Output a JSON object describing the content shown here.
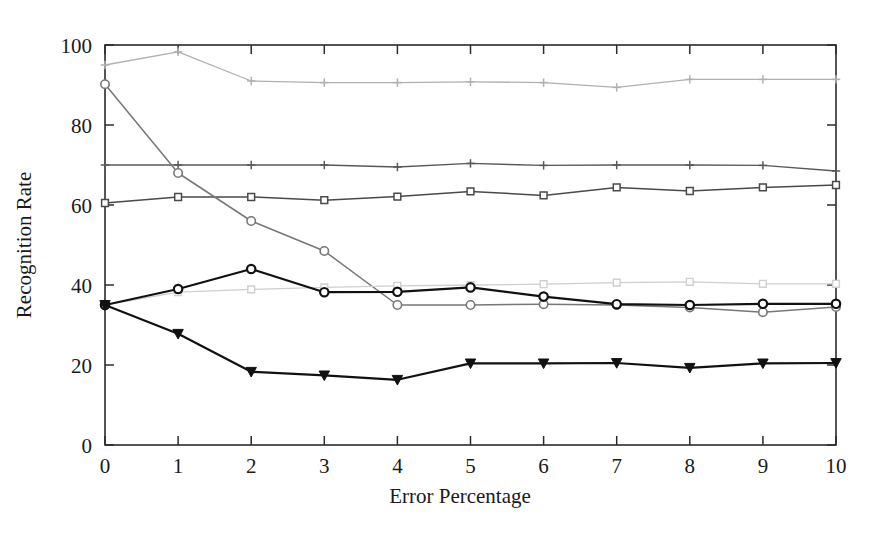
{
  "chart_data": {
    "type": "line",
    "title": "",
    "xlabel": "Error Percentage",
    "ylabel": "Recognition Rate",
    "x": [
      0,
      1,
      2,
      3,
      4,
      5,
      6,
      7,
      8,
      9,
      10
    ],
    "xlim": [
      0,
      10
    ],
    "ylim": [
      0,
      100
    ],
    "xticks": [
      "0",
      "1",
      "2",
      "3",
      "4",
      "5",
      "6",
      "7",
      "8",
      "9",
      "10"
    ],
    "yticks": [
      "0",
      "20",
      "40",
      "60",
      "80",
      "100"
    ],
    "ytick_values": [
      0,
      20,
      40,
      60,
      80,
      100
    ],
    "grid": false,
    "legend": "none",
    "series": [
      {
        "name": "series-1-top",
        "marker": "plus",
        "color": "#b0b0b0",
        "linewidth": 1.3,
        "values": [
          95.0,
          98.3,
          91.0,
          90.6,
          90.6,
          90.8,
          90.6,
          89.4,
          91.4,
          91.4,
          91.4
        ]
      },
      {
        "name": "series-2-flat70",
        "marker": "plus",
        "color": "#595959",
        "linewidth": 1.4,
        "values": [
          70.0,
          70.0,
          70.0,
          70.0,
          69.5,
          70.4,
          69.9,
          70.0,
          70.0,
          69.9,
          68.5
        ]
      },
      {
        "name": "series-3-squares-mid",
        "marker": "square",
        "color": "#4a4a4a",
        "linewidth": 1.5,
        "values": [
          60.5,
          62.0,
          62.0,
          61.2,
          62.1,
          63.4,
          62.4,
          64.4,
          63.5,
          64.4,
          65.0
        ]
      },
      {
        "name": "series-4-declining",
        "marker": "circle",
        "color": "#777777",
        "linewidth": 1.5,
        "values": [
          90.2,
          68.0,
          56.0,
          48.5,
          35.0,
          35.0,
          35.2,
          35.0,
          34.4,
          33.2,
          34.5
        ]
      },
      {
        "name": "series-5-light-squares",
        "marker": "square",
        "color": "#cfcfcf",
        "linewidth": 1.3,
        "values": [
          35.0,
          38.2,
          38.9,
          39.4,
          39.8,
          40.0,
          40.2,
          40.6,
          40.8,
          40.3,
          40.3
        ]
      },
      {
        "name": "series-6-circles-dark",
        "marker": "circle",
        "color": "#111111",
        "linewidth": 2.2,
        "values": [
          35.0,
          39.0,
          44.0,
          38.2,
          38.3,
          39.4,
          37.1,
          35.2,
          35.0,
          35.3,
          35.3
        ]
      },
      {
        "name": "series-7-triangles",
        "marker": "triangle-down",
        "color": "#111111",
        "linewidth": 2.2,
        "values": [
          35.0,
          27.8,
          18.3,
          17.4,
          16.3,
          20.4,
          20.4,
          20.5,
          19.3,
          20.4,
          20.5
        ]
      }
    ]
  },
  "figure": {
    "background": "#ffffff",
    "axis_color": "#2b2b2b"
  }
}
